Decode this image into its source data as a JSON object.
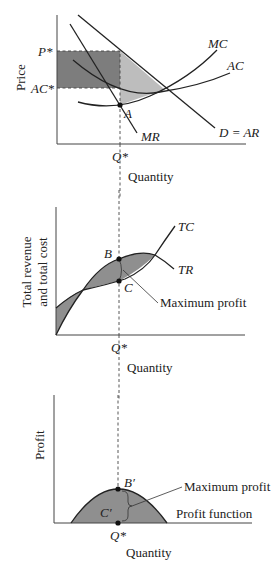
{
  "figure": {
    "panels": [
      {
        "id": "price-panel",
        "y_label": "Price",
        "x_label": "Quantity",
        "y_ticks": [
          "P*",
          "AC*"
        ],
        "x_tick": "Q*",
        "curves": [
          "MC",
          "AC",
          "D = AR",
          "MR"
        ],
        "point": "A",
        "colors": {
          "profit_rect": "#7d7d7d",
          "triangle": "#bdbdbd"
        }
      },
      {
        "id": "total-panel",
        "y_label_line1": "Total revenue",
        "y_label_line2": "and total cost",
        "x_label": "Quantity",
        "x_tick": "Q*",
        "curves": [
          "TC",
          "TR"
        ],
        "points": [
          "B",
          "C"
        ],
        "annotation": "Maximum profit",
        "colors": {
          "shading": "#8f8f8f"
        }
      },
      {
        "id": "profit-panel",
        "y_label": "Profit",
        "x_label": "Quantity",
        "x_tick": "Q*",
        "curve": "Profit function",
        "points": [
          "B′",
          "C′"
        ],
        "annotation": "Maximum profit",
        "colors": {
          "shading": "#8f8f8f"
        }
      }
    ]
  }
}
